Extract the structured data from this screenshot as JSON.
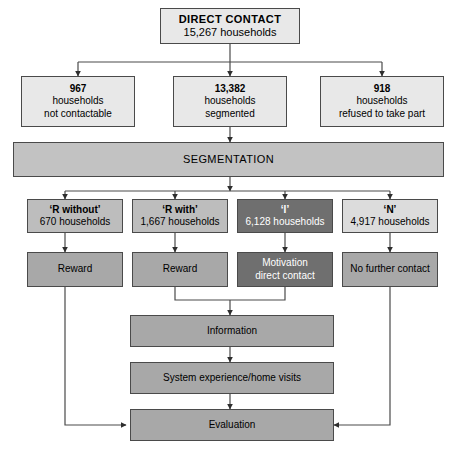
{
  "diagram": {
    "type": "flowchart",
    "colors": {
      "pale": "#e8e8e8",
      "light": "#dcdcdc",
      "mid": "#c2c2c2",
      "medium": "#bdbdbd",
      "gray": "#a8a8a8",
      "dark": "#6f6f6f",
      "line": "#4a4a4a",
      "background": "#ffffff"
    },
    "nodes": {
      "root": {
        "line1": "DIRECT CONTACT",
        "line2": "15,267 households"
      },
      "outcomes": [
        {
          "count": "967",
          "line2": "households",
          "line3": "not contactable"
        },
        {
          "count": "13,382",
          "line2": "households",
          "line3": "segmented"
        },
        {
          "count": "918",
          "line2": "households",
          "line3": "refused to take part"
        }
      ],
      "segmentation": {
        "label": "SEGMENTATION"
      },
      "segments": [
        {
          "label": "‘R without’",
          "count": "670 households"
        },
        {
          "label": "‘R with’",
          "count": "1,667 households"
        },
        {
          "label": "‘I’",
          "count": "6,128 households"
        },
        {
          "label": "‘N’",
          "count": "4,917 households"
        }
      ],
      "actions": [
        {
          "line1": "Reward",
          "line2": ""
        },
        {
          "line1": "Reward",
          "line2": ""
        },
        {
          "line1": "Motivation",
          "line2": "direct contact"
        },
        {
          "line1": "No further contact",
          "line2": ""
        }
      ],
      "stages": [
        {
          "label": "Information"
        },
        {
          "label": "System experience/home visits"
        },
        {
          "label": "Evaluation"
        }
      ]
    },
    "caption": ""
  }
}
